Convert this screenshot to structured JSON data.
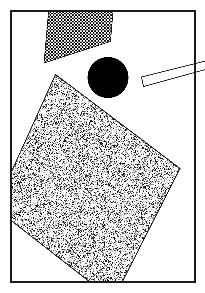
{
  "figure": {
    "title": "Abstract geometric composition",
    "canvas": {
      "width": 205,
      "height": 293,
      "background": "#ffffff"
    },
    "frame": {
      "name": "border-frame",
      "x": 11,
      "y": 11,
      "width": 184,
      "height": 271,
      "stroke": "#1a1a1a",
      "stroke_width": 1.6,
      "fill": "none",
      "label": "Rectangular border frame"
    },
    "shapes": [
      {
        "id": "checkered-triangle",
        "name": "checkered-triangle",
        "kind": "triangle",
        "fill_style": "checkerboard",
        "fill_color": "#000000",
        "background_color": "#ffffff",
        "check_size": 1.6,
        "stroke": "#111111",
        "stroke_width": 0.7,
        "points": [
          [
            48.5,
            11.8
          ],
          [
            113.0,
            11.8
          ],
          [
            110.5,
            41.5
          ],
          [
            44.0,
            63.0
          ]
        ],
        "clip_to_frame": true,
        "label": "Checkerboard-filled triangle, upper left"
      },
      {
        "id": "black-circle",
        "name": "black-circle",
        "kind": "circle",
        "fill_style": "solid",
        "fill_color": "#000000",
        "stroke": "none",
        "stroke_width": 0,
        "cx": 108.0,
        "cy": 77.5,
        "r": 20.5,
        "clip_to_frame": true,
        "label": "Solid black filled circle"
      },
      {
        "id": "outlined-bar",
        "name": "outlined-bar-parallelogram",
        "kind": "polygon",
        "fill_style": "solid",
        "fill_color": "#ffffff",
        "stroke": "#222222",
        "stroke_width": 0.9,
        "points": [
          [
            141.5,
            77.0
          ],
          [
            205.5,
            61.0
          ],
          [
            205.5,
            69.5
          ],
          [
            143.5,
            86.5
          ]
        ],
        "clip_to_frame": false,
        "label": "Thin white outlined bar crossing right frame edge"
      },
      {
        "id": "stippled-quad",
        "name": "stippled-quadrilateral",
        "kind": "polygon",
        "fill_style": "stipple",
        "fill_color": "#111111",
        "background_color": "#ffffff",
        "stipple_density": 0.36,
        "stipple_dot_size": 1.0,
        "stroke": "#222222",
        "stroke_width": 1.0,
        "points": [
          [
            55.5,
            74.5
          ],
          [
            180.0,
            168.5
          ],
          [
            113.0,
            300.0
          ],
          [
            -5.0,
            208.0
          ]
        ],
        "clip_to_frame": true,
        "label": "Large stipple-textured quadrilateral, rotated"
      }
    ],
    "draw_order": [
      "checkered-triangle",
      "stippled-quad",
      "black-circle",
      "outlined-bar",
      "border-frame"
    ],
    "palette": {
      "ink": "#000000",
      "frame_stroke": "#1a1a1a",
      "outline": "#222222",
      "paper": "#ffffff"
    }
  }
}
